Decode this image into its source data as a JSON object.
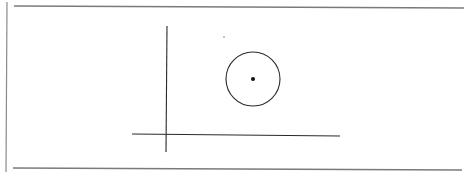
{
  "figure": {
    "type": "geometry-diagram",
    "colors": {
      "background": "#ffffff",
      "stroke": "#2a2a2a",
      "frame": "#7a7a7a"
    },
    "frame": {
      "top_rule": {
        "x1": 14,
        "y1": 6,
        "x2": 464,
        "y2": 8
      },
      "left_rule": {
        "x1": 7,
        "y1": 2,
        "x2": 6,
        "y2": 172
      },
      "bottom_rule": {
        "x1": 13,
        "y1": 168,
        "x2": 462,
        "y2": 170
      }
    },
    "axes": {
      "vertical": {
        "x1": 167,
        "y1": 26,
        "x2": 166,
        "y2": 152
      },
      "horizontal": {
        "x1": 132,
        "y1": 134,
        "x2": 340,
        "y2": 136
      }
    },
    "circle": {
      "cx": 253,
      "cy": 79,
      "r": 27
    },
    "center_point": {
      "cx": 253,
      "cy": 79,
      "r": 2
    },
    "stray_point": {
      "cx": 224,
      "cy": 37,
      "r": 0.8
    }
  }
}
